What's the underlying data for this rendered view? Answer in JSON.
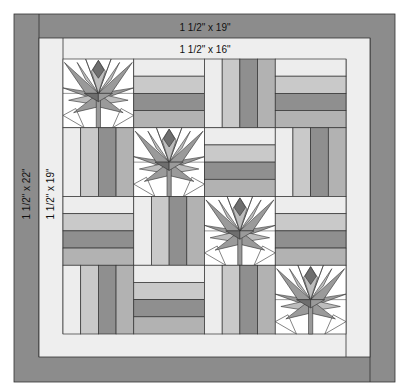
{
  "labels": {
    "outer_top": "1 1/2\" x 19\"",
    "inner_top": "1 1/2\" x 16\"",
    "outer_side": "1 1/2\" x 22\"",
    "inner_side": "1 1/2\" x 19\""
  },
  "colors": {
    "outer_border": "#8c8c8c",
    "inner_border": "#eeeeee",
    "stripe_1": "#ededed",
    "stripe_2": "#c9c9c9",
    "stripe_3": "#8f8f8f",
    "stripe_4": "#b2b2b2",
    "lotus_dark": "#6e6e6e",
    "lotus_mid": "#9a9a9a",
    "lotus_light": "#bdbdbd",
    "background": "#ffffff",
    "outline": "#333333"
  },
  "grid": {
    "rows": [
      [
        "lotus",
        "horizontal",
        "vertical",
        "horizontal"
      ],
      [
        "vertical",
        "lotus",
        "horizontal",
        "vertical"
      ],
      [
        "horizontal",
        "vertical",
        "lotus",
        "horizontal"
      ],
      [
        "vertical",
        "horizontal",
        "vertical",
        "lotus"
      ]
    ]
  }
}
